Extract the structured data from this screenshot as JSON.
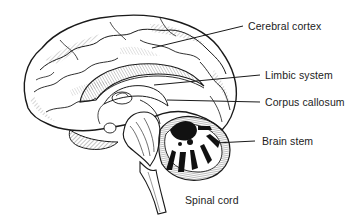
{
  "diagram": {
    "style": "black-and-white pen illustration",
    "labels": [
      {
        "id": "cerebral-cortex",
        "text": "Cerebral cortex",
        "x": 248,
        "y": 22
      },
      {
        "id": "limbic-system",
        "text": "Limbic system",
        "x": 265,
        "y": 71
      },
      {
        "id": "corpus-callosum",
        "text": "Corpus callosum",
        "x": 265,
        "y": 98
      },
      {
        "id": "brain-stem",
        "text": "Brain stem",
        "x": 262,
        "y": 137
      },
      {
        "id": "spinal-cord",
        "text": "Spinal cord",
        "x": 185,
        "y": 196
      }
    ],
    "colors": {
      "ink": "#1a1a1a",
      "label_text": "#222222",
      "background": "#ffffff"
    }
  }
}
